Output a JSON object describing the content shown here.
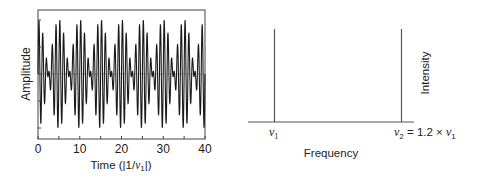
{
  "chart_data": [
    {
      "type": "line",
      "title": "",
      "xlabel": "Time (|1/ν₁|)",
      "xlabel_parts": {
        "prefix": "Time (|1/",
        "nu": "ν",
        "sub": "1",
        "suffix": "|)"
      },
      "ylabel": "Amplitude",
      "xlim": [
        0,
        40
      ],
      "x_ticks": [
        0,
        10,
        20,
        30,
        40
      ],
      "x_tick_labels": [
        "0",
        "10",
        "20",
        "30",
        "40"
      ],
      "x_minor_ticks": [
        5,
        15,
        25,
        35
      ],
      "y_ticks_count": 5,
      "y_tick_labels": [],
      "grid": false,
      "series": [
        {
          "name": "superposition",
          "formula": "sin(2π·ν1·t) + sin(2π·ν2·t)",
          "nu1": 1.0,
          "nu2": 1.2,
          "beat_period": 5,
          "ylim": [
            -2.1,
            2.1
          ]
        }
      ],
      "baseline": 0
    },
    {
      "type": "bar",
      "title": "",
      "xlabel": "Frequency",
      "ylabel": "Intensity",
      "categories": [
        "ν1",
        "ν2 = 1.2 × ν1"
      ],
      "category_labels": [
        {
          "nu": "ν",
          "sub": "1",
          "suffix": ""
        },
        {
          "nu": "ν",
          "sub": "2",
          "suffix": " = 1.2 × ",
          "nu2": "ν",
          "sub2": "1"
        }
      ],
      "x": [
        1.0,
        1.2
      ],
      "values": [
        1,
        1
      ],
      "grid": false
    }
  ]
}
